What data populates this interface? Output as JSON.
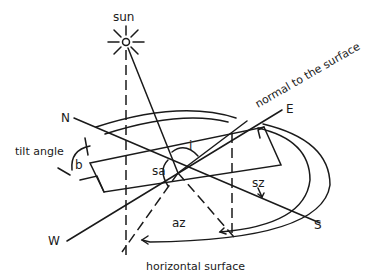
{
  "diagram": {
    "labels": {
      "sun": "sun",
      "north": "N",
      "east": "E",
      "south": "S",
      "west": "W",
      "tilt_angle": "tilt angle",
      "tilt_symbol": "b",
      "incidence_symbol": "i",
      "solar_altitude_symbol": "sa",
      "surface_azimuth_symbol": "sz",
      "solar_azimuth_symbol": "az",
      "normal": "normal to the surface",
      "horizontal_surface": "horizontal surface"
    },
    "colors": {
      "line": "#1a1a1a",
      "background": "#ffffff"
    }
  }
}
